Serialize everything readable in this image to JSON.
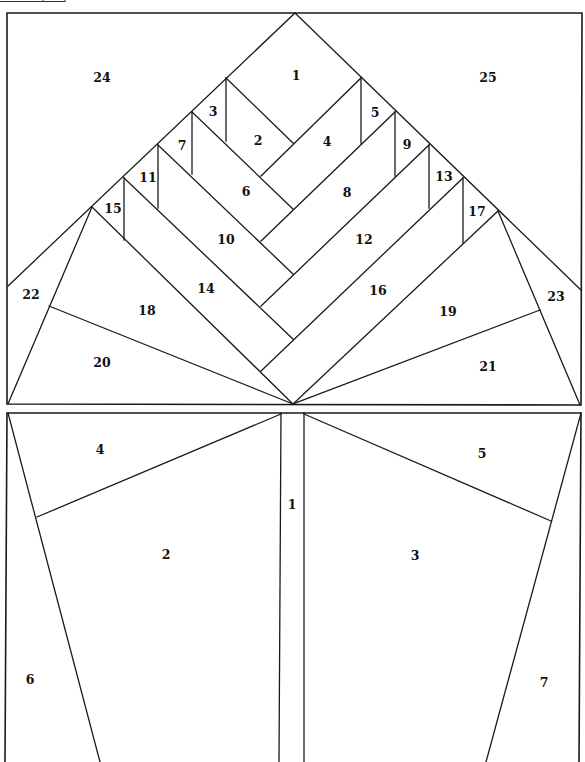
{
  "diagram": {
    "line_color": "#1a1a1a",
    "background": "#ffffff",
    "sections": [
      {
        "id": "top-block",
        "name": "Herringbone tree top",
        "piece_labels": [
          "1",
          "2",
          "3",
          "4",
          "5",
          "6",
          "7",
          "8",
          "9",
          "10",
          "11",
          "12",
          "13",
          "14",
          "15",
          "16",
          "17",
          "18",
          "19",
          "20",
          "21",
          "22",
          "23",
          "24",
          "25"
        ]
      },
      {
        "id": "bottom-block",
        "name": "Trunk / pot",
        "piece_labels": [
          "1",
          "2",
          "3",
          "4",
          "5",
          "6",
          "7"
        ]
      }
    ]
  },
  "labels": {
    "top": {
      "p1": "1",
      "p2": "2",
      "p3": "3",
      "p4": "4",
      "p5": "5",
      "p6": "6",
      "p7": "7",
      "p8": "8",
      "p9": "9",
      "p10": "10",
      "p11": "11",
      "p12": "12",
      "p13": "13",
      "p14": "14",
      "p15": "15",
      "p16": "16",
      "p17": "17",
      "p18": "18",
      "p19": "19",
      "p20": "20",
      "p21": "21",
      "p22": "22",
      "p23": "23",
      "p24": "24",
      "p25": "25"
    },
    "bottom": {
      "p1": "1",
      "p2": "2",
      "p3": "3",
      "p4": "4",
      "p5": "5",
      "p6": "6",
      "p7": "7"
    }
  }
}
